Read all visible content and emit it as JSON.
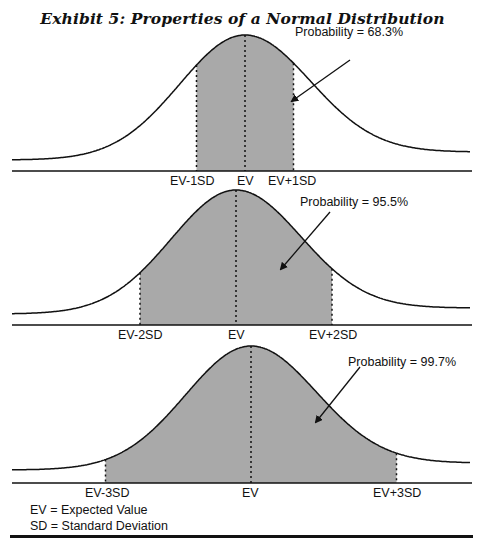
{
  "title": "Exhibit 5: Properties of a Normal Distribution",
  "panels": [
    {
      "probability_label": "Probability = 68.3%",
      "labels": {
        "left": "EV-1SD",
        "center": "EV",
        "right": "EV+1SD"
      }
    },
    {
      "probability_label": "Probability = 95.5%",
      "labels": {
        "left": "EV-2SD",
        "center": "EV",
        "right": "EV+2SD"
      }
    },
    {
      "probability_label": "Probability = 99.7%",
      "labels": {
        "left": "EV-3SD",
        "center": "EV",
        "right": "EV+3SD"
      }
    }
  ],
  "legend": {
    "ev": "EV = Expected Value",
    "sd": "SD = Standard Deviation"
  },
  "colors": {
    "shade": "#a9a9a9",
    "line": "#111111"
  },
  "chart_data": [
    {
      "type": "area",
      "title": "Normal distribution, EV ± 1SD shaded",
      "shaded_range_sd": [
        -1,
        1
      ],
      "probability_pct": 68.3,
      "tick_labels": [
        "EV-1SD",
        "EV",
        "EV+1SD"
      ]
    },
    {
      "type": "area",
      "title": "Normal distribution, EV ± 2SD shaded",
      "shaded_range_sd": [
        -2,
        2
      ],
      "probability_pct": 95.5,
      "tick_labels": [
        "EV-2SD",
        "EV",
        "EV+2SD"
      ]
    },
    {
      "type": "area",
      "title": "Normal distribution, EV ± 3SD shaded",
      "shaded_range_sd": [
        -3,
        3
      ],
      "probability_pct": 99.7,
      "tick_labels": [
        "EV-3SD",
        "EV",
        "EV+3SD"
      ]
    }
  ]
}
